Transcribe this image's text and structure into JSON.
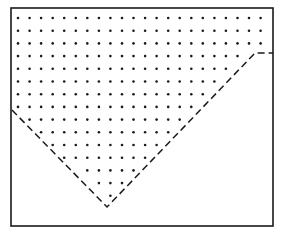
{
  "diagram": {
    "width": 281,
    "height": 232,
    "background": "#ffffff",
    "ink_color": "#1a1a1a",
    "box": {
      "x1": 11,
      "y1": 8,
      "x2": 273,
      "y2": 226,
      "stroke_width": 1.6
    },
    "dashed_boundary": {
      "points": [
        [
          12,
          110
        ],
        [
          107,
          207
        ],
        [
          255,
          53
        ],
        [
          273,
          53
        ]
      ],
      "dash": "7,4",
      "stroke_width": 1.5
    },
    "dot_grid": {
      "x_start": 18,
      "y_start": 18,
      "dx": 11.55,
      "dy": 12.7,
      "cols": 22,
      "rows": 15,
      "radius": 1.3,
      "region": "above dashed boundary inside box"
    }
  }
}
